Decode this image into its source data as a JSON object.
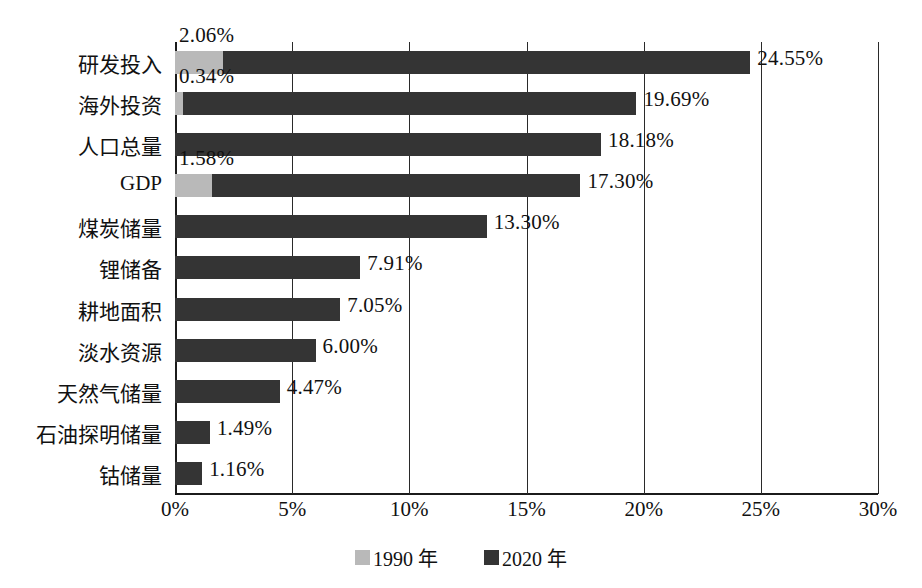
{
  "chart_data": {
    "type": "bar",
    "orientation": "horizontal",
    "stacked": true,
    "title": "",
    "xlabel": "",
    "ylabel": "",
    "xlim": [
      0,
      30
    ],
    "xtick_labels": [
      "0%",
      "5%",
      "10%",
      "15%",
      "20%",
      "25%",
      "30%"
    ],
    "xticks": [
      0,
      5,
      10,
      15,
      20,
      25,
      30
    ],
    "grid": true,
    "legend_position": "bottom",
    "categories": [
      "研发投入",
      "海外投资",
      "人口总量",
      "GDP",
      "煤炭储量",
      "锂储备",
      "耕地面积",
      "淡水资源",
      "天然气储量",
      "石油探明储量",
      "钴储量"
    ],
    "series": [
      {
        "name": "1990 年",
        "color": "#b9b9b9",
        "values": [
          2.06,
          0.34,
          null,
          1.58,
          null,
          null,
          null,
          null,
          null,
          null,
          null
        ],
        "labels": [
          "2.06%",
          "0.34%",
          "",
          "1.58%",
          "",
          "",
          "",
          "",
          "",
          "",
          ""
        ]
      },
      {
        "name": "2020 年",
        "color": "#343434",
        "values": [
          24.55,
          19.69,
          18.18,
          17.3,
          13.3,
          7.91,
          7.05,
          6.0,
          4.47,
          1.49,
          1.16
        ],
        "labels": [
          "24.55%",
          "19.69%",
          "18.18%",
          "17.30%",
          "13.30%",
          "7.91%",
          "7.05%",
          "6.00%",
          "4.47%",
          "1.49%",
          "1.16%"
        ]
      }
    ]
  },
  "legend": {
    "items": [
      {
        "label": "1990 年",
        "color": "#b9b9b9"
      },
      {
        "label": "2020 年",
        "color": "#343434"
      }
    ]
  },
  "colors": {
    "series_1990": "#b9b9b9",
    "series_2020": "#343434",
    "axis": "#1b1b1b",
    "text": "#111111",
    "background": "#ffffff"
  }
}
